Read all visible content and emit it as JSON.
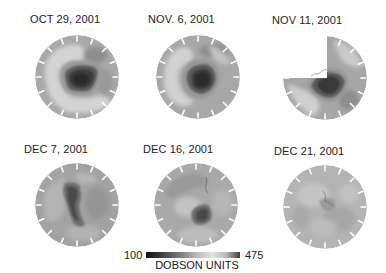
{
  "panels": [
    {
      "date": "OCT 29, 2001",
      "hole": "large-dark"
    },
    {
      "date": "NOV. 6, 2001",
      "hole": "large-dark"
    },
    {
      "date": "NOV 11, 2001",
      "hole": "large-dark-partial-data"
    },
    {
      "date": "DEC 7, 2001",
      "hole": "elongated-medium"
    },
    {
      "date": "DEC 16, 2001",
      "hole": "small-dark"
    },
    {
      "date": "DEC 21, 2001",
      "hole": "none"
    }
  ],
  "colorbar": {
    "min_label": "100",
    "max_label": "475",
    "units_label": "DOBSON UNITS",
    "gradient": [
      "#111111",
      "#444444",
      "#888888",
      "#c8c8c8",
      "#e6e6e6",
      "#b0b0b0",
      "#555555"
    ]
  }
}
